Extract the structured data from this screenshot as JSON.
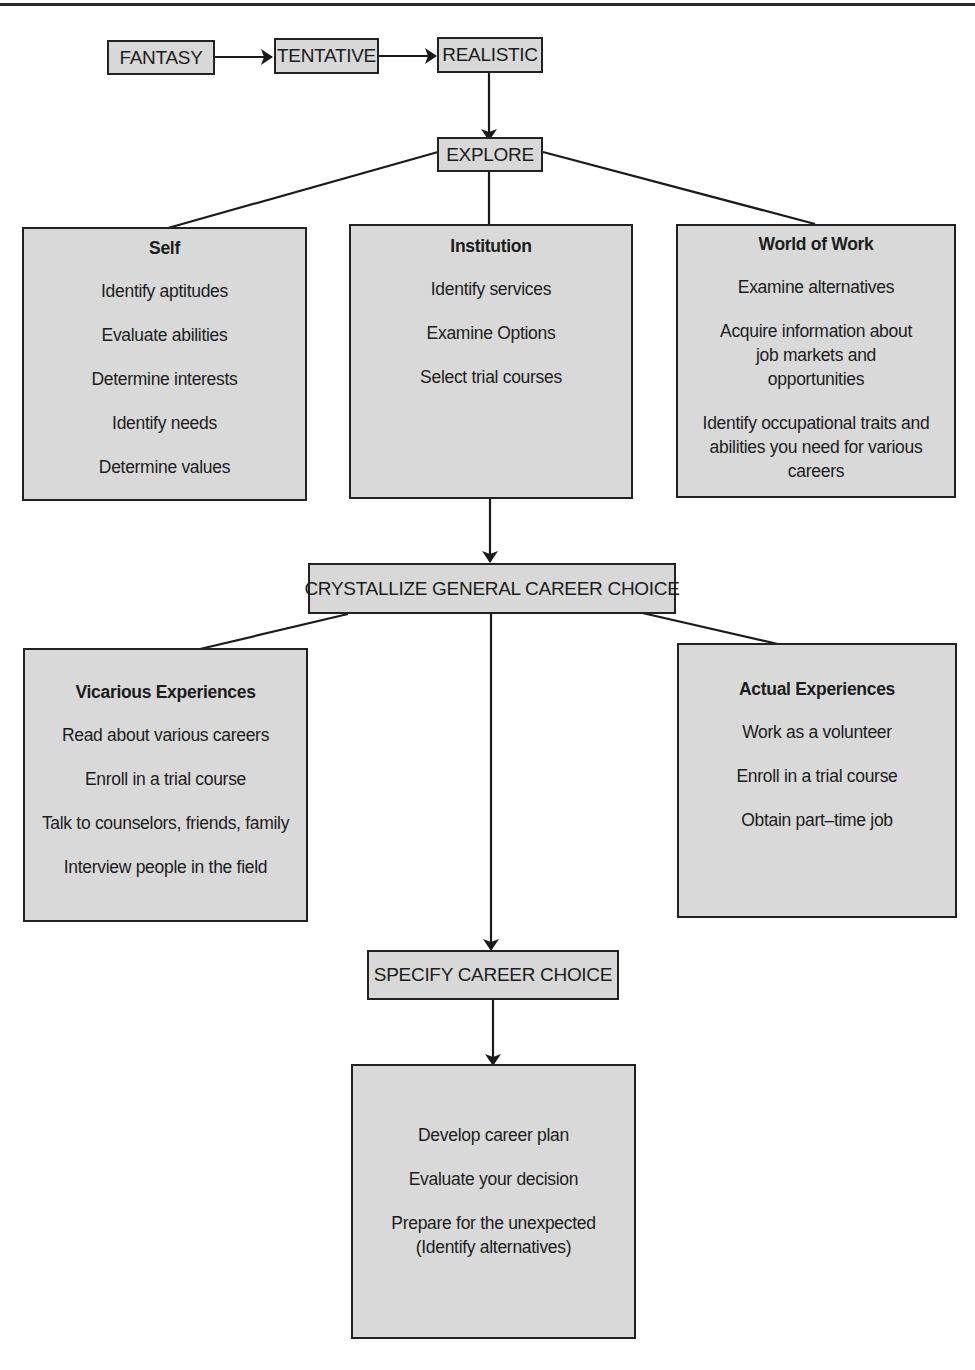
{
  "stages": {
    "fantasy": "FANTASY",
    "tentative": "TENTATIVE",
    "realistic": "REALISTIC",
    "explore": "EXPLORE",
    "crystallize": "CRYSTALLIZE GENERAL CAREER CHOICE",
    "specify": "SPECIFY CAREER CHOICE"
  },
  "explore_panels": {
    "self": {
      "title": "Self",
      "items": [
        "Identify aptitudes",
        "Evaluate abilities",
        "Determine interests",
        "Identify needs",
        "Determine values"
      ]
    },
    "institution": {
      "title": "Institution",
      "items": [
        "Identify services",
        "Examine Options",
        "Select trial courses"
      ]
    },
    "world_of_work": {
      "title": "World of Work",
      "items": [
        "Examine alternatives",
        "Acquire information about job markets and opportunities",
        "Identify occupational traits and abilities you need for various careers"
      ]
    }
  },
  "experience_panels": {
    "vicarious": {
      "title": "Vicarious Experiences",
      "items": [
        "Read about various careers",
        "Enroll in a trial course",
        "Talk to counselors, friends, family",
        "Interview people in the field"
      ]
    },
    "actual": {
      "title": "Actual Experiences",
      "items": [
        "Work as a volunteer",
        "Enroll in a trial course",
        "Obtain part–time job"
      ]
    }
  },
  "final_panel": {
    "items": [
      "Develop career plan",
      "Evaluate your decision",
      "Prepare for the unexpected (Identify alternatives)"
    ]
  },
  "colors": {
    "box_fill": "#d8d8d8",
    "border": "#222222",
    "line": "#1a1a1a"
  }
}
